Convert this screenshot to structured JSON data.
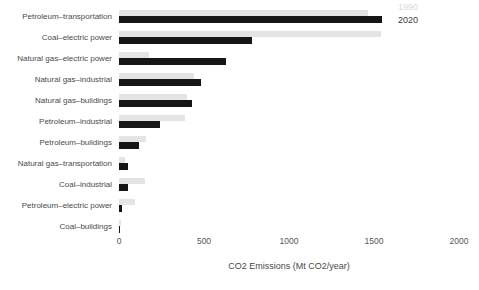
{
  "chart_data": {
    "type": "bar",
    "orientation": "horizontal",
    "title": "",
    "xlabel": "CO2 Emissions (Mt CO2/year)",
    "ylabel": "",
    "categories": [
      "Petroleum–transportation",
      "Coal–electric power",
      "Natural gas–electric power",
      "Natural gas–industrial",
      "Natural gas–buildings",
      "Petroleum–industrial",
      "Petroleum–buildings",
      "Natural gas–transportation",
      "Coal–industrial",
      "Petroleum–electric power",
      "Coal–buildings"
    ],
    "series": [
      {
        "name": "1990",
        "color": "#e4e4e4",
        "legend_text_color": "#d9d9d9",
        "values": [
          1465,
          1540,
          175,
          440,
          400,
          390,
          160,
          35,
          155,
          97,
          12
        ]
      },
      {
        "name": "2020",
        "color": "#161616",
        "legend_text_color": "#3a3a3a",
        "values": [
          1545,
          785,
          630,
          480,
          430,
          240,
          120,
          55,
          50,
          18,
          3
        ]
      }
    ],
    "xlim": [
      0,
      2000
    ],
    "xticks": [
      0,
      500,
      1000,
      1500,
      2000
    ],
    "grid": false,
    "legend_position": "top-right"
  },
  "colors": {
    "background": "#ffffff",
    "category_label_text": "#4a4a4a",
    "tick_text": "#555555",
    "axis_title_text": "#4a4a4a"
  }
}
